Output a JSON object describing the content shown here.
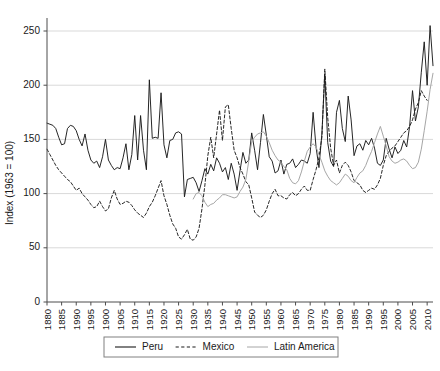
{
  "chart_data": {
    "type": "line",
    "title": "",
    "xlabel": "",
    "ylabel": "Index (1963 = 100)",
    "ylim": [
      0,
      262
    ],
    "xlim": [
      1880,
      2012
    ],
    "yticks": [
      0,
      50,
      100,
      150,
      200,
      250
    ],
    "ytick_labels": [
      "0",
      "50",
      "100",
      "150",
      "200",
      "250"
    ],
    "xticks": [
      1880,
      1885,
      1890,
      1895,
      1900,
      1905,
      1910,
      1915,
      1920,
      1925,
      1930,
      1935,
      1940,
      1945,
      1950,
      1955,
      1960,
      1965,
      1970,
      1975,
      1980,
      1985,
      1990,
      1995,
      2000,
      2005,
      2010
    ],
    "xtick_labels": [
      "1880",
      "1885",
      "1990",
      "1995",
      "1900",
      "1905",
      "1910",
      "1915",
      "1920",
      "1925",
      "1930",
      "1935",
      "1940",
      "1945",
      "1950",
      "1955",
      "1960",
      "1965",
      "1970",
      "1975",
      "1980",
      "1985",
      "1990",
      "1995",
      "2000",
      "2005",
      "2010"
    ],
    "grid": true,
    "grid_axis": "y",
    "legend_position": "below-axes",
    "colors": {
      "peru": "#1a1a1a",
      "mexico": "#1a1a1a",
      "latin_america": "#a6a6a6",
      "gridline": "#d9d9d9",
      "axis": "#4d4d4d",
      "background": "#ffffff"
    },
    "series": [
      {
        "name": "Peru",
        "style": "solid",
        "color": "#1a1a1a",
        "x_start": 1880,
        "values": [
          165,
          164,
          163,
          160,
          152,
          145,
          146,
          160,
          163,
          162,
          158,
          150,
          144,
          155,
          140,
          131,
          128,
          130,
          124,
          134,
          150,
          131,
          126,
          122,
          124,
          123,
          133,
          146,
          122,
          136,
          172,
          131,
          172,
          140,
          122,
          205,
          151,
          152,
          151,
          193,
          145,
          133,
          149,
          150,
          156,
          157,
          155,
          97,
          113,
          114,
          115,
          110,
          102,
          112,
          123,
          118,
          127,
          121,
          133,
          128,
          120,
          124,
          113,
          128,
          118,
          103,
          121,
          138,
          128,
          131,
          156,
          140,
          122,
          147,
          173,
          154,
          134,
          130,
          119,
          121,
          131,
          118,
          127,
          128,
          132,
          124,
          127,
          131,
          130,
          128,
          137,
          175,
          143,
          124,
          155,
          210,
          147,
          130,
          125,
          175,
          186,
          160,
          148,
          190,
          168,
          135,
          144,
          146,
          140,
          149,
          145,
          151,
          142,
          128,
          126,
          131,
          151,
          141,
          133,
          143,
          137,
          140,
          149,
          143,
          162,
          195,
          167,
          180,
          212,
          240,
          200,
          255,
          218,
          234,
          222
        ],
        "notes": "Peru real wage / index series, annual 1880-2010"
      },
      {
        "name": "Mexico",
        "style": "dashed",
        "color": "#1a1a1a",
        "x_start": 1880,
        "values": [
          141,
          136,
          131,
          126,
          122,
          119,
          116,
          113,
          111,
          107,
          103,
          105,
          100,
          97,
          94,
          90,
          87,
          88,
          93,
          88,
          84,
          86,
          96,
          103,
          95,
          90,
          91,
          93,
          92,
          89,
          85,
          82,
          80,
          78,
          82,
          88,
          92,
          98,
          105,
          112,
          98,
          90,
          80,
          72,
          68,
          60,
          58,
          62,
          67,
          58,
          57,
          60,
          68,
          86,
          108,
          135,
          152,
          133,
          155,
          177,
          149,
          180,
          182,
          160,
          140,
          133,
          124,
          118,
          111,
          108,
          96,
          83,
          80,
          78,
          80,
          85,
          93,
          100,
          104,
          98,
          98,
          96,
          95,
          99,
          101,
          98,
          100,
          104,
          107,
          103,
          103,
          113,
          122,
          133,
          152,
          215,
          170,
          142,
          126,
          131,
          119,
          126,
          129,
          126,
          120,
          112,
          110,
          108,
          103,
          101,
          103,
          105,
          104,
          108,
          114,
          126,
          135,
          139,
          142,
          144,
          148,
          152,
          156,
          158,
          162,
          168,
          178,
          184,
          195,
          190,
          186
        ],
        "notes": "Mexico real wage / index series, annual 1880-2010"
      },
      {
        "name": "Latin America",
        "style": "solid",
        "color": "#a6a6a6",
        "x_start": 1930,
        "values": [
          95,
          100,
          101,
          98,
          92,
          88,
          90,
          91,
          94,
          96,
          99,
          99,
          98,
          97,
          96,
          97,
          102,
          106,
          113,
          130,
          148,
          152,
          155,
          156,
          157,
          153,
          147,
          140,
          135,
          131,
          129,
          125,
          122,
          114,
          110,
          109,
          112,
          120,
          130,
          139,
          143,
          146,
          143,
          136,
          129,
          121,
          116,
          112,
          110,
          108,
          110,
          114,
          118,
          116,
          112,
          110,
          115,
          119,
          121,
          126,
          133,
          139,
          147,
          155,
          162,
          153,
          144,
          134,
          130,
          128,
          129,
          131,
          132,
          130,
          126,
          123,
          124,
          129,
          141,
          158,
          176,
          196,
          211,
          228,
          230,
          234,
          236,
          238,
          236,
          234,
          232
        ],
        "notes": "Latin America aggregate, annual 1930-2010 (gray line, begins around 1930)"
      }
    ]
  },
  "legend": {
    "entries": [
      {
        "label": "Peru",
        "style": "solid",
        "color": "#1a1a1a"
      },
      {
        "label": "Mexico",
        "style": "dashed",
        "color": "#1a1a1a"
      },
      {
        "label": "Latin America",
        "style": "solid",
        "color": "#a6a6a6"
      }
    ]
  }
}
